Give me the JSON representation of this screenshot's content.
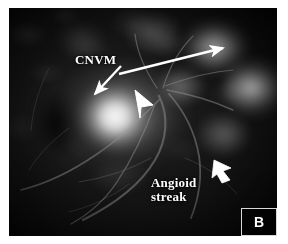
{
  "figure": {
    "panel_letter": "B",
    "modality": "fundus fluorescein angiogram",
    "background_color": "#040404",
    "annotation_color": "#ffffff",
    "page_background": "#ffffff"
  },
  "annotations": [
    {
      "id": "cnvm",
      "label": "CNVM",
      "name": "annotation-label-cnvm",
      "pointers": [
        {
          "name": "cnvm-long-arrow",
          "description": "long arrow to upper-right hyperfluorescent patch",
          "from": [
            118,
            72
          ],
          "to": [
            228,
            47
          ]
        },
        {
          "name": "cnvm-short-arrow",
          "description": "short arrow down-left into bright lesion",
          "from": [
            118,
            66
          ],
          "to": [
            93,
            92
          ]
        },
        {
          "name": "cnvm-arrowhead",
          "description": "solid arrowhead over the central hyperfluorescent membrane",
          "at": [
            143,
            98
          ]
        }
      ]
    },
    {
      "id": "angioid-streak",
      "label": "Angioid\nstreak",
      "name": "annotation-label-angioid-streak",
      "pointers": [
        {
          "name": "angioid-streak-arrowhead",
          "description": "solid arrowhead pointing up-left at the streak",
          "at": [
            218,
            165
          ]
        }
      ]
    }
  ],
  "panel_badge": {
    "text": "B",
    "border_color": "#d9d9d9"
  }
}
